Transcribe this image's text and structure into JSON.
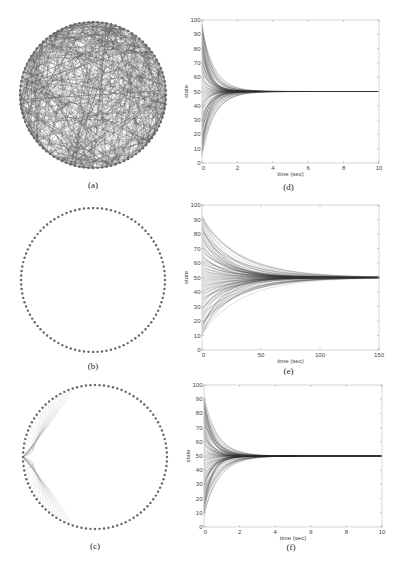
{
  "figure": {
    "panels_left": [
      {
        "id": "a",
        "caption": "(a)",
        "graph": "random",
        "cx": 93,
        "cy": 95,
        "r": 73,
        "caption_y": 188,
        "nodes": 100
      },
      {
        "id": "b",
        "caption": "(b)",
        "graph": "ring",
        "cx": 93,
        "cy": 280,
        "r": 72,
        "caption_y": 369,
        "nodes": 100
      },
      {
        "id": "c",
        "caption": "(c)",
        "graph": "ring-plus-star",
        "cx": 95,
        "cy": 457,
        "r": 72,
        "caption_y": 549,
        "nodes": 100
      }
    ]
  },
  "chart_data": [
    {
      "id": "d",
      "type": "line",
      "caption": "(d)",
      "title": "",
      "xlabel": "time (sec)",
      "ylabel": "state",
      "xlim": [
        0,
        10
      ],
      "ylim": [
        0,
        100
      ],
      "xticks": [
        0,
        2,
        4,
        6,
        8,
        10
      ],
      "yticks": [
        0,
        10,
        20,
        30,
        40,
        50,
        60,
        70,
        80,
        90,
        100
      ],
      "series_description": "100 node states starting uniformly in [5,98], converging exponentially to consensus value ~50",
      "initial_range": [
        5,
        98
      ],
      "consensus": 50,
      "settling_time": 5,
      "rate": 1.8,
      "box": {
        "x0": 202,
        "y0": 20,
        "x1": 379,
        "y1": 163
      },
      "caption_y": 190,
      "grid": false,
      "legend": null
    },
    {
      "id": "e",
      "type": "line",
      "caption": "(e)",
      "title": "",
      "xlabel": "time (sec)",
      "ylabel": "state",
      "xlim": [
        0,
        150
      ],
      "ylim": [
        0,
        100
      ],
      "xticks": [
        0,
        50,
        100,
        150
      ],
      "yticks": [
        0,
        10,
        20,
        30,
        40,
        50,
        60,
        70,
        80,
        90,
        100
      ],
      "series_description": "100 node states starting in [10,93], converging slowly to consensus ~50 by ~120 sec",
      "initial_range": [
        10,
        93
      ],
      "consensus": 50,
      "settling_time": 120,
      "rate": 0.04,
      "box": {
        "x0": 202,
        "y0": 205,
        "x1": 379,
        "y1": 350
      },
      "caption_y": 374,
      "grid": false,
      "legend": null
    },
    {
      "id": "f",
      "type": "line",
      "caption": "(f)",
      "title": "",
      "xlabel": "time (sec)",
      "ylabel": "state",
      "xlim": [
        0,
        10
      ],
      "ylim": [
        0,
        100
      ],
      "xticks": [
        0,
        2,
        4,
        6,
        8,
        10
      ],
      "yticks": [
        0,
        10,
        20,
        30,
        40,
        50,
        60,
        70,
        80,
        90,
        100
      ],
      "series_description": "100 node states starting in [8,92], converging to consensus ~50 by ~4 sec",
      "initial_range": [
        8,
        92
      ],
      "consensus": 50,
      "settling_time": 4,
      "rate": 1.6,
      "box": {
        "x0": 204,
        "y0": 385,
        "x1": 382,
        "y1": 527
      },
      "caption_y": 550,
      "grid": false,
      "legend": null
    }
  ]
}
